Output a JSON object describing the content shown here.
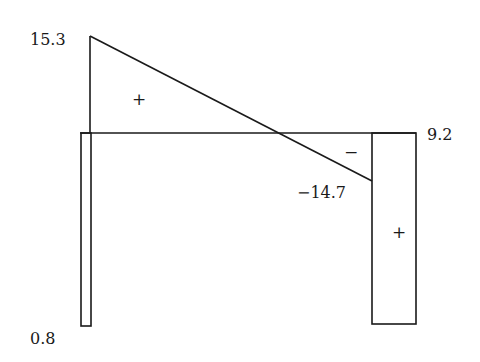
{
  "diagram": {
    "type": "bending-moment-diagram-frame",
    "labels": {
      "top_left_value": "15.3",
      "right_beam_value": "9.2",
      "negative_value": "−14.7",
      "bottom_left_value": "0.8"
    },
    "signs": {
      "beam_positive": "+",
      "beam_negative": "−",
      "right_column_positive": "+"
    },
    "colors": {
      "line": "#1a1a1a",
      "background": "#ffffff"
    }
  }
}
